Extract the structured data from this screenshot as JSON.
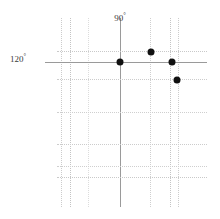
{
  "chart_data": {
    "type": "scatter",
    "title": "",
    "xlabel": "",
    "ylabel": "",
    "grid": true,
    "legend": null,
    "background_color": "#ffffff",
    "point_color": "#111111",
    "major_line_color": "#9a9a9a",
    "minor_line_color": "#c9c9c9",
    "faint_line_color": "#dedede",
    "axis_labels": [
      {
        "id": "meridian",
        "text": "90",
        "degree_symbol": "°",
        "value": 90,
        "orientation": "vertical",
        "x": 120,
        "y": 12
      },
      {
        "id": "parallel",
        "text": "120",
        "degree_symbol": "°",
        "value": 120,
        "orientation": "horizontal",
        "x": 10,
        "y": 58
      }
    ],
    "vertical_gridlines": [
      {
        "x": 61,
        "style": "dotted",
        "weight": "minor",
        "color": "#cccccc",
        "top": 18,
        "bottom": 207
      },
      {
        "x": 70,
        "style": "dotted",
        "weight": "minor",
        "color": "#c4c4c4",
        "top": 18,
        "bottom": 207
      },
      {
        "x": 88,
        "style": "dotted",
        "weight": "faint",
        "color": "#dcdcdc",
        "top": 18,
        "bottom": 207
      },
      {
        "x": 120,
        "style": "solid",
        "weight": "major",
        "color": "#9a9a9a",
        "top": 18,
        "bottom": 207
      },
      {
        "x": 150,
        "style": "dotted",
        "weight": "minor",
        "color": "#cfcfcf",
        "top": 18,
        "bottom": 207
      },
      {
        "x": 170,
        "style": "dotted",
        "weight": "minor",
        "color": "#c4c4c4",
        "top": 18,
        "bottom": 207
      },
      {
        "x": 178,
        "style": "dotted",
        "weight": "minor",
        "color": "#cccccc",
        "top": 18,
        "bottom": 207
      }
    ],
    "horizontal_gridlines": [
      {
        "y": 51,
        "style": "dotted",
        "weight": "minor",
        "color": "#c9c9c9",
        "left": 57,
        "right": 207
      },
      {
        "y": 62,
        "style": "solid",
        "weight": "major",
        "color": "#9a9a9a",
        "left": 45,
        "right": 207
      },
      {
        "y": 79,
        "style": "dotted",
        "weight": "minor",
        "color": "#cccccc",
        "left": 57,
        "right": 207
      },
      {
        "y": 112,
        "style": "dotted",
        "weight": "minor",
        "color": "#cfcfcf",
        "left": 57,
        "right": 207
      },
      {
        "y": 144,
        "style": "dotted",
        "weight": "minor",
        "color": "#cccccc",
        "left": 57,
        "right": 207
      },
      {
        "y": 166,
        "style": "dotted",
        "weight": "minor",
        "color": "#cfcfcf",
        "left": 57,
        "right": 207
      },
      {
        "y": 177,
        "style": "dotted",
        "weight": "minor",
        "color": "#c9c9c9",
        "left": 57,
        "right": 207
      }
    ],
    "points": [
      {
        "id": "p1",
        "x": 120,
        "y": 62,
        "size": 7
      },
      {
        "id": "p2",
        "x": 151,
        "y": 52,
        "size": 7
      },
      {
        "id": "p3",
        "x": 172,
        "y": 62,
        "size": 7
      },
      {
        "id": "p4",
        "x": 177,
        "y": 80,
        "size": 7
      }
    ]
  }
}
